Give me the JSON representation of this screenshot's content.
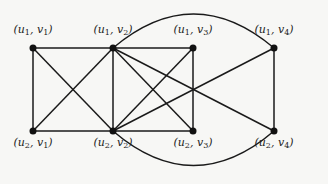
{
  "diagram": {
    "type": "graph",
    "nodes": [
      {
        "id": "u1v1",
        "u": "1",
        "v": "1",
        "x": 33,
        "y": 48,
        "label_y": 30
      },
      {
        "id": "u1v2",
        "u": "1",
        "v": "2",
        "x": 113,
        "y": 48,
        "label_y": 30
      },
      {
        "id": "u1v3",
        "u": "1",
        "v": "3",
        "x": 193,
        "y": 48,
        "label_y": 30
      },
      {
        "id": "u1v4",
        "u": "1",
        "v": "4",
        "x": 274,
        "y": 48,
        "label_y": 30
      },
      {
        "id": "u2v1",
        "u": "2",
        "v": "1",
        "x": 33,
        "y": 131,
        "label_y": 143
      },
      {
        "id": "u2v2",
        "u": "2",
        "v": "2",
        "x": 113,
        "y": 131,
        "label_y": 143
      },
      {
        "id": "u2v3",
        "u": "2",
        "v": "3",
        "x": 193,
        "y": 131,
        "label_y": 143
      },
      {
        "id": "u2v4",
        "u": "2",
        "v": "4",
        "x": 274,
        "y": 131,
        "label_y": 143
      }
    ],
    "edges": [
      {
        "from": "u1v1",
        "to": "u1v2"
      },
      {
        "from": "u1v1",
        "to": "u2v1"
      },
      {
        "from": "u1v1",
        "to": "u2v2"
      },
      {
        "from": "u2v1",
        "to": "u1v2"
      },
      {
        "from": "u2v1",
        "to": "u2v2"
      },
      {
        "from": "u1v2",
        "to": "u2v2"
      },
      {
        "from": "u1v2",
        "to": "u1v3"
      },
      {
        "from": "u1v2",
        "to": "u2v3"
      },
      {
        "from": "u1v2",
        "to": "u2v4"
      },
      {
        "from": "u2v2",
        "to": "u1v3"
      },
      {
        "from": "u2v2",
        "to": "u2v3"
      },
      {
        "from": "u2v2",
        "to": "u1v4"
      },
      {
        "from": "u1v3",
        "to": "u2v3"
      },
      {
        "from": "u1v4",
        "to": "u2v4"
      }
    ],
    "arcs": [
      {
        "from": "u1v2",
        "to": "u1v4",
        "ctrl_y": -20
      },
      {
        "from": "u2v2",
        "to": "u2v4",
        "ctrl_y": 200
      }
    ],
    "colors": {
      "edge": "#1a1a1a",
      "node": "#111111",
      "background": "#f7f7f5"
    }
  }
}
